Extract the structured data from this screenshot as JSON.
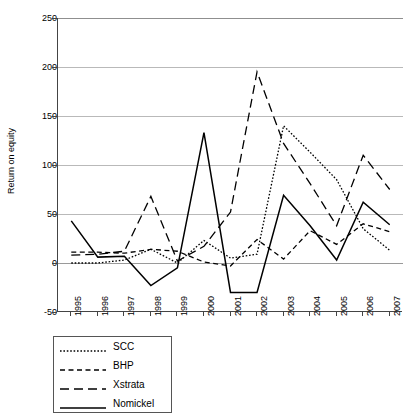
{
  "chart_data": {
    "type": "line",
    "title": "",
    "xlabel": "",
    "ylabel": "Return on equity",
    "x": [
      1995,
      1996,
      1997,
      1998,
      1999,
      2000,
      2001,
      2002,
      2003,
      2004,
      2005,
      2006,
      2007
    ],
    "categories": [
      "1995",
      "1996",
      "1997",
      "1998",
      "1999",
      "2000",
      "2001",
      "2002",
      "2003",
      "2004",
      "2005",
      "2006",
      "2007"
    ],
    "ylim": [
      -50,
      250
    ],
    "yticks": [
      -50,
      0,
      50,
      100,
      150,
      200,
      250
    ],
    "ytick_labels": [
      "-50",
      "0",
      "50",
      "100",
      "150",
      "200",
      "250"
    ],
    "grid": "horizontal",
    "legend_position": "below-left",
    "series": [
      {
        "name": "SCC",
        "style": "dotted",
        "color": "#000000",
        "values": [
          0,
          0,
          3,
          14,
          0,
          23,
          5,
          9,
          140,
          113,
          85,
          35,
          13
        ]
      },
      {
        "name": "BHP",
        "style": "dashed",
        "color": "#000000",
        "values": [
          11,
          11,
          10,
          14,
          12,
          1,
          -3,
          24,
          4,
          33,
          19,
          40,
          32
        ]
      },
      {
        "name": "Xstrata",
        "style": "long-dash",
        "color": "#000000",
        "values": [
          8,
          9,
          12,
          68,
          2,
          17,
          52,
          195,
          122,
          81,
          38,
          110,
          75
        ]
      },
      {
        "name": "Nomickel",
        "style": "solid",
        "color": "#000000",
        "values": [
          43,
          6,
          7,
          -23,
          -5,
          133,
          -30,
          -30,
          69,
          38,
          3,
          62,
          39
        ]
      }
    ]
  },
  "axes": {
    "y_title": "Return on equity"
  },
  "legend": {
    "items": [
      {
        "label": "SCC",
        "style": "dotted"
      },
      {
        "label": "BHP",
        "style": "dashed"
      },
      {
        "label": "Xstrata",
        "style": "long-dash"
      },
      {
        "label": "Nomickel",
        "style": "solid"
      }
    ]
  }
}
